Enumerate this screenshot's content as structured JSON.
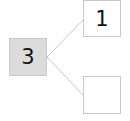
{
  "diagram": {
    "type": "number-bond",
    "whole": {
      "value": "3",
      "fill": "#dcdcdc"
    },
    "parts": [
      {
        "value": "1",
        "fill": "#ffffff"
      },
      {
        "value": "",
        "fill": "#ffffff"
      }
    ],
    "line_color": "#c8c8c8"
  }
}
